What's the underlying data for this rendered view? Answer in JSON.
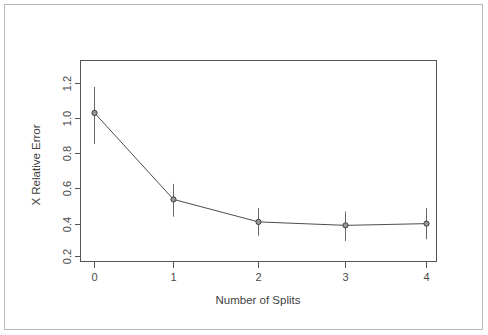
{
  "chart_data": {
    "type": "line",
    "title": "",
    "subtitle": "",
    "xlabel": "Number of Splits",
    "ylabel": "X Relative Error",
    "x": [
      0,
      1,
      2,
      3,
      4
    ],
    "xtick_labels": [
      "0",
      "1",
      "2",
      "3",
      "4"
    ],
    "ytick_labels": [
      "0.2",
      "0.4",
      "0.6",
      "0.8",
      "1.0",
      "1.2"
    ],
    "ytick_values": [
      0.2,
      0.4,
      0.6,
      0.8,
      1.0,
      1.2
    ],
    "xlim": [
      -0.28,
      4.28
    ],
    "ylim": [
      0.15,
      1.3
    ],
    "grid": false,
    "legend": null,
    "legend_position": "none",
    "series": [
      {
        "name": "X Relative Error",
        "values": [
          1.03,
          0.53,
          0.4,
          0.38,
          0.39
        ],
        "errors_upper": [
          1.18,
          0.62,
          0.48,
          0.46,
          0.48
        ],
        "errors_lower": [
          0.85,
          0.43,
          0.32,
          0.29,
          0.3
        ],
        "marker": "circle",
        "line_color": "#4d4d4d",
        "marker_fill": "#9a9a9a",
        "error_color": "#666666"
      }
    ],
    "colors": {
      "line": "#4d4d4d",
      "marker_fill": "#9a9a9a",
      "marker_stroke": "#3c3c3c",
      "error_bar": "#666666",
      "axis": "#555555",
      "text": "#4a4a4a",
      "frame": "#b9b9b9",
      "background": "#ffffff"
    }
  },
  "figure": {
    "xaxis_title": "Number of Splits",
    "yaxis_title": "X Relative Error",
    "xtick_0": "0",
    "xtick_1": "1",
    "xtick_2": "2",
    "xtick_3": "3",
    "xtick_4": "4",
    "ytick_0": "0.2",
    "ytick_1": "0.4",
    "ytick_2": "0.6",
    "ytick_3": "0.8",
    "ytick_4": "1.0",
    "ytick_5": "1.2"
  }
}
